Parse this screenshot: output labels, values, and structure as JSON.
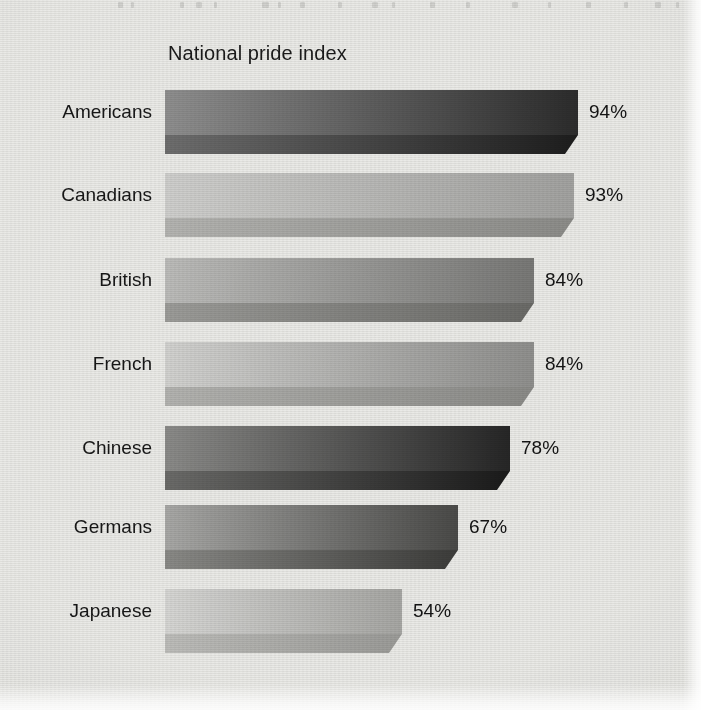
{
  "chart": {
    "title": "National pride index"
  },
  "chart_data": {
    "type": "bar",
    "orientation": "horizontal",
    "title": "National pride index",
    "xlabel": "",
    "ylabel": "",
    "xlim": [
      0,
      100
    ],
    "grid": false,
    "legend": null,
    "value_suffix": "%",
    "categories": [
      "Americans",
      "Canadians",
      "British",
      "French",
      "Chinese",
      "Germans",
      "Japanese"
    ],
    "values": [
      94,
      93,
      84,
      84,
      78,
      67,
      54
    ],
    "value_labels": [
      "94%",
      "93%",
      "84%",
      "84%",
      "78%",
      "67%",
      "54%"
    ],
    "bars": [
      {
        "category": "Americans",
        "value": 94,
        "value_label": "94%",
        "top_row": 90,
        "bar_px_end": 578,
        "top_face_gradient_from": "#8f8f8f",
        "top_face_gradient_to": "#2c2c2c",
        "bottom_face_gradient_from": "#6e6e6e",
        "bottom_face_gradient_to": "#1d1d1d"
      },
      {
        "category": "Canadians",
        "value": 93,
        "value_label": "93%",
        "top_row": 173,
        "bar_px_end": 574,
        "top_face_gradient_from": "#cfcfcd",
        "top_face_gradient_to": "#a2a2a0",
        "bottom_face_gradient_from": "#b4b4b1",
        "bottom_face_gradient_to": "#8c8c89",
        "bottom_face_left_band": "#a9a9a6"
      },
      {
        "category": "British",
        "value": 84,
        "value_label": "84%",
        "top_row": 258,
        "bar_px_end": 534,
        "top_face_gradient_from": "#bcbcba",
        "top_face_gradient_to": "#787876",
        "bottom_face_gradient_from": "#9c9c99",
        "bottom_face_gradient_to": "#6a6a67"
      },
      {
        "category": "French",
        "value": 84,
        "value_label": "84%",
        "top_row": 342,
        "bar_px_end": 534,
        "top_face_gradient_from": "#d2d2d0",
        "top_face_gradient_to": "#8f8f8d",
        "bottom_face_gradient_from": "#b3b3b0",
        "bottom_face_gradient_to": "#8b8b88"
      },
      {
        "category": "Chinese",
        "value": 78,
        "value_label": "78%",
        "top_row": 426,
        "bar_px_end": 510,
        "top_face_gradient_from": "#8b8b89",
        "top_face_gradient_to": "#262626",
        "bottom_face_gradient_from": "#6b6b69",
        "bottom_face_gradient_to": "#1a1a1a"
      },
      {
        "category": "Germans",
        "value": 67,
        "value_label": "67%",
        "top_row": 505,
        "bar_px_end": 458,
        "top_face_gradient_from": "#a8a8a6",
        "top_face_gradient_to": "#4a4a48",
        "bottom_face_gradient_from": "#8a8a87",
        "bottom_face_gradient_to": "#3c3c3a"
      },
      {
        "category": "Japanese",
        "value": 54,
        "value_label": "54%",
        "top_row": 589,
        "bar_px_end": 402,
        "top_face_gradient_from": "#d6d6d4",
        "top_face_gradient_to": "#a6a6a3",
        "bottom_face_gradient_from": "#bdbdba",
        "bottom_face_gradient_to": "#9b9b98"
      }
    ]
  },
  "layout": {
    "bar_start_x": 165,
    "label_right_x": 152,
    "bevel_px": 13,
    "top_face_height": 45,
    "bottom_face_height": 19,
    "value_label_gap": 11,
    "background_color": "#eaeae7",
    "text_color": "#171717"
  }
}
